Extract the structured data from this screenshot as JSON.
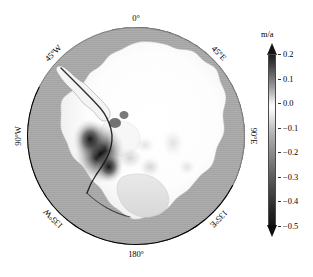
{
  "figure": {
    "type": "map",
    "projection": "south-polar-stereographic",
    "region": "Antarctica"
  },
  "map": {
    "longitude_labels": [
      {
        "name": "lon-0",
        "text": "0°",
        "angle_deg": 0,
        "rotation": 0
      },
      {
        "name": "lon-45e",
        "text": "45°E",
        "angle_deg": 45,
        "rotation": 45
      },
      {
        "name": "lon-90e",
        "text": "90°E",
        "angle_deg": 90,
        "rotation": 90
      },
      {
        "name": "lon-135e",
        "text": "135°E",
        "angle_deg": 135,
        "rotation": 135
      },
      {
        "name": "lon-180",
        "text": "180°",
        "angle_deg": 180,
        "rotation": 0
      },
      {
        "name": "lon-135w",
        "text": "135°W",
        "angle_deg": 225,
        "rotation": -135
      },
      {
        "name": "lon-90w",
        "text": "90°W",
        "angle_deg": 270,
        "rotation": -90
      },
      {
        "name": "lon-45w",
        "text": "45°W",
        "angle_deg": 315,
        "rotation": -45
      }
    ]
  },
  "colorbar": {
    "unit": "m/a",
    "orientation": "vertical",
    "extend": "both",
    "vmin": -0.5,
    "vmax": 0.2,
    "colormap": "grayscale",
    "ticks": [
      {
        "value": 0.2,
        "label": "0.2"
      },
      {
        "value": 0.1,
        "label": "0.1"
      },
      {
        "value": 0.0,
        "label": "0.0"
      },
      {
        "value": -0.1,
        "label": "−0.1"
      },
      {
        "value": -0.2,
        "label": "−0.2"
      },
      {
        "value": -0.3,
        "label": "−0.3"
      },
      {
        "value": -0.4,
        "label": "−0.4"
      },
      {
        "value": -0.5,
        "label": "−0.5"
      }
    ]
  },
  "chart_data": {
    "type": "heatmap",
    "title": "",
    "xlabel": "",
    "ylabel": "",
    "zlabel": "m/a",
    "zlim": [
      -0.5,
      0.2
    ],
    "colormap": "grayscale",
    "legend_position": "right",
    "grid": false,
    "projection": "south-polar-stereographic",
    "graticule_longitudes": [
      0,
      45,
      90,
      135,
      180,
      225,
      270,
      315
    ],
    "colorbar_ticks": [
      0.2,
      0.1,
      0.0,
      -0.1,
      -0.2,
      -0.3,
      -0.4,
      -0.5
    ],
    "annotations": [
      "Ocean / off-ice background rendered at a uniform mid-gray value near -0.15 m/a",
      "Interior East Antarctic plateau is near-white, i.e. values close to 0.0 to +0.05 m/a",
      "Strongest negative (dark) signal over the Amundsen Sea sector of West Antarctica, reaching the -0.5 m/a saturation limit",
      "Secondary weak negative (light-gray) patches in the interior of West Antarctica and near Wilkes Land"
    ],
    "regions": [
      {
        "name": "East Antarctic interior",
        "approx_value": 0.02
      },
      {
        "name": "Amundsen Sea sector",
        "approx_value": -0.5
      },
      {
        "name": "Antarctic Peninsula margin",
        "approx_value": -0.35
      },
      {
        "name": "Ross Ice Shelf",
        "approx_value": -0.03
      },
      {
        "name": "Ronne-Filchner Ice Shelf",
        "approx_value": 0.0
      },
      {
        "name": "Wilkes Land coast",
        "approx_value": -0.08
      },
      {
        "name": "Ocean background",
        "approx_value": -0.15
      }
    ]
  }
}
